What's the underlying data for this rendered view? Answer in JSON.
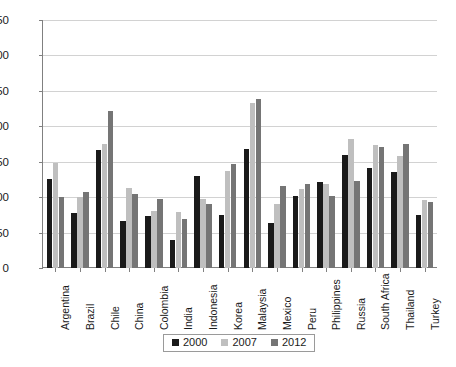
{
  "chart_data": {
    "type": "bar",
    "title": "",
    "subtitle": "",
    "xlabel": "",
    "ylabel": "",
    "ylim": [
      0,
      350
    ],
    "ytick_step": 50,
    "yticks": [
      "0",
      "50",
      "100",
      "150",
      "200",
      "250",
      "300",
      "350"
    ],
    "grid": true,
    "legend_position": "bottom",
    "categories": [
      "Argentina",
      "Brazil",
      "Chile",
      "China",
      "Colombia",
      "India",
      "Indonesia",
      "Korea",
      "Malaysia",
      "Mexico",
      "Peru",
      "Philippines",
      "Russia",
      "South Africa",
      "Thailand",
      "Turkey"
    ],
    "series": [
      {
        "name": "2000",
        "color": "#1a1a1a",
        "values": [
          125,
          78,
          167,
          66,
          73,
          40,
          130,
          75,
          168,
          63,
          102,
          122,
          160,
          141,
          135,
          75
        ]
      },
      {
        "name": "2007",
        "color": "#bfbfbf",
        "values": [
          148,
          100,
          175,
          113,
          80,
          79,
          97,
          137,
          233,
          90,
          112,
          118,
          182,
          173,
          158,
          96
        ]
      },
      {
        "name": "2012",
        "color": "#757575",
        "values": [
          100,
          107,
          222,
          105,
          97,
          69,
          90,
          147,
          238,
          116,
          118,
          101,
          123,
          171,
          175,
          93
        ]
      }
    ]
  },
  "legend": {
    "items": [
      {
        "label": "2000",
        "color": "#1a1a1a"
      },
      {
        "label": "2007",
        "color": "#bfbfbf"
      },
      {
        "label": "2012",
        "color": "#757575"
      }
    ]
  },
  "caption": ""
}
